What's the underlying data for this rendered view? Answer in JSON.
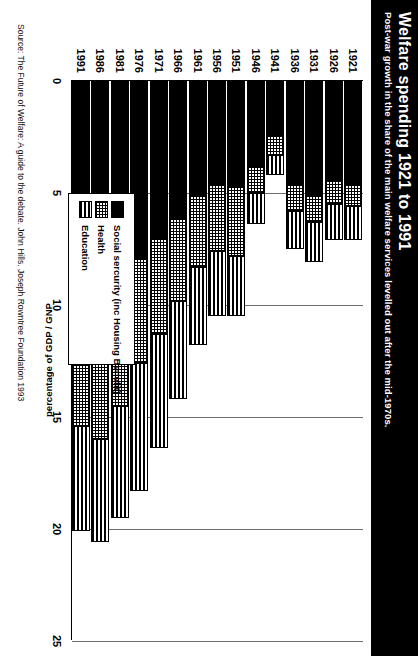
{
  "title": {
    "main": "Welfare spending 1921 to 1991",
    "sub": "Post-war growth in the share of the main welfare services levelled out after the mid-1970s."
  },
  "source": "Source: The Future of Welfare: A guide to the debate. John Hills. Joseph Rowntree Foundation 1993",
  "legend": {
    "items": [
      {
        "label": "Social sercurity (inc Housing Benefit)",
        "swatch": "solid-black-swatch"
      },
      {
        "label": "Health",
        "swatch": "dotted-grey-swatch"
      },
      {
        "label": "Education",
        "swatch": "horizontal-stripe-swatch"
      }
    ]
  },
  "chart_data": {
    "type": "bar",
    "stacked": true,
    "orientation": "horizontal-rotated",
    "title": "Welfare spending 1921 to 1991",
    "subtitle": "Post-war growth in the share of the main welfare services levelled out after the mid-1970s.",
    "xlabel": "",
    "ylabel": "percentage of GDP / GNP",
    "ylim": [
      0,
      25
    ],
    "ticks": [
      0,
      5,
      10,
      15,
      20,
      25
    ],
    "grid": true,
    "legend_position": "inside-lower-left",
    "categories": [
      "1921",
      "1926",
      "1931",
      "1936",
      "1941",
      "1946",
      "1951",
      "1956",
      "1961",
      "1966",
      "1971",
      "1976",
      "1981",
      "1986",
      "1991"
    ],
    "series": [
      {
        "name": "Social sercurity (inc Housing Benefit)",
        "values": [
          4.6,
          4.4,
          5.1,
          4.6,
          2.4,
          3.8,
          4.7,
          4.6,
          5.1,
          6.1,
          7.0,
          7.9,
          9.6,
          11.0,
          10.1
        ]
      },
      {
        "name": "Health",
        "values": [
          1.0,
          1.1,
          1.2,
          1.2,
          0.9,
          1.2,
          3.1,
          3.0,
          3.2,
          3.7,
          4.3,
          4.7,
          4.9,
          5.0,
          5.3
        ]
      },
      {
        "name": "Education",
        "values": [
          1.5,
          1.6,
          1.8,
          1.7,
          0.9,
          1.4,
          2.7,
          2.9,
          3.5,
          4.4,
          5.1,
          5.7,
          5.0,
          4.6,
          4.7
        ]
      }
    ],
    "totals": [
      7.1,
      7.1,
      8.1,
      7.5,
      4.2,
      6.4,
      10.5,
      10.5,
      11.8,
      14.2,
      16.4,
      18.3,
      19.5,
      20.6,
      20.1
    ]
  }
}
